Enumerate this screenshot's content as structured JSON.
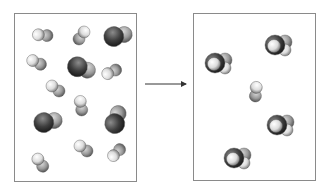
{
  "diagram": {
    "type": "reaction-schematic",
    "left_box": {
      "label": "reactants",
      "rect": [
        14,
        13,
        123,
        169
      ],
      "molecules": [
        {
          "kind": "h2",
          "x": 42,
          "y": 35,
          "angle": -30
        },
        {
          "kind": "h2",
          "x": 82,
          "y": 35,
          "angle": 90
        },
        {
          "kind": "dark",
          "x": 117,
          "y": 35,
          "angle": 30
        },
        {
          "kind": "h2",
          "x": 36,
          "y": 62,
          "angle": -10
        },
        {
          "kind": "dark",
          "x": 81,
          "y": 67,
          "angle": 60
        },
        {
          "kind": "h2",
          "x": 111,
          "y": 72,
          "angle": -60
        },
        {
          "kind": "h2",
          "x": 55,
          "y": 88,
          "angle": 0
        },
        {
          "kind": "h2",
          "x": 81,
          "y": 105,
          "angle": 45
        },
        {
          "kind": "dark",
          "x": 47,
          "y": 121,
          "angle": 30
        },
        {
          "kind": "dark",
          "x": 115,
          "y": 120,
          "angle": -30
        },
        {
          "kind": "h2",
          "x": 83,
          "y": 148,
          "angle": 0
        },
        {
          "kind": "h2",
          "x": 40,
          "y": 162,
          "angle": 20
        },
        {
          "kind": "h2",
          "x": 116,
          "y": 153,
          "angle": -80
        }
      ]
    },
    "arrow": {
      "x1": 145,
      "y1": 84,
      "x2": 186,
      "y2": 84
    },
    "right_box": {
      "label": "products",
      "rect": [
        193,
        13,
        123,
        168
      ],
      "molecules": [
        {
          "kind": "product",
          "x": 217,
          "y": 63
        },
        {
          "kind": "product",
          "x": 277,
          "y": 45
        },
        {
          "kind": "h2",
          "x": 256,
          "y": 91,
          "angle": 60
        },
        {
          "kind": "product",
          "x": 279,
          "y": 125
        },
        {
          "kind": "product",
          "x": 236,
          "y": 158
        }
      ]
    },
    "colors": {
      "border": "#8a8a8a",
      "arrow": "#333333",
      "light_atom": "#f2f2f2",
      "mid_atom": "#9a9a9a",
      "dark_atom": "#3a3a3a"
    }
  }
}
